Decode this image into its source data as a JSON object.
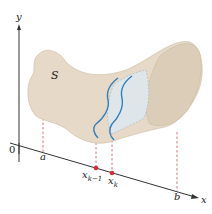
{
  "figure": {
    "axes": {
      "y_label": "y",
      "x_label": "x",
      "origin_label": "0"
    },
    "solid_label": "S",
    "x_marks": {
      "a": "a",
      "x_k_minus_1": "x",
      "x_k_minus_1_sub": "k−1",
      "x_k": "x",
      "x_k_sub": "k",
      "b": "b"
    },
    "colors": {
      "solid_fill": "#e6d9c8",
      "solid_shade": "#d9c9b3",
      "slice_fill": "#dfe6ea",
      "slice_curve": "#2f7fbf",
      "dashed_lines": "#d2505a",
      "points": "#d62c3a",
      "axes": "#333333"
    }
  }
}
